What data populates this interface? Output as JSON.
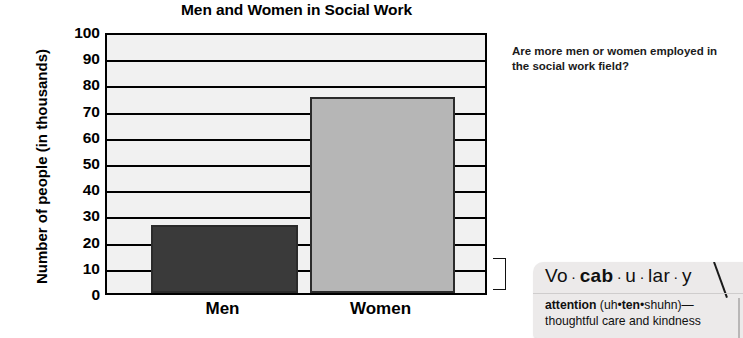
{
  "chart_data": {
    "type": "bar",
    "title": "Men and Women in Social Work",
    "xlabel": "",
    "ylabel": "Number of people (in thousands)",
    "categories": [
      "Men",
      "Women"
    ],
    "values": [
      26,
      75
    ],
    "series": [
      {
        "name": "Number of people (in thousands)",
        "values": [
          26,
          75
        ]
      }
    ],
    "ylim": [
      0,
      100
    ],
    "ytick_labels": [
      "0",
      "10",
      "20",
      "30",
      "40",
      "50",
      "60",
      "70",
      "80",
      "90",
      "100"
    ],
    "ytick_values": [
      0,
      10,
      20,
      30,
      40,
      50,
      60,
      70,
      80,
      90,
      100
    ],
    "grid": true,
    "legend": "none",
    "bar_colors": [
      "#3a3a3a",
      "#b6b6b6"
    ],
    "plot_background": "#f1f1f1",
    "axis_color": "#000000"
  },
  "question": {
    "text": "Are more men or women employed in the social work field?"
  },
  "vocabulary": {
    "heading_parts": [
      {
        "text": "Vo",
        "bold": false
      },
      {
        "text": " · ",
        "bold": false
      },
      {
        "text": "cab",
        "bold": true
      },
      {
        "text": " · ",
        "bold": false
      },
      {
        "text": "u",
        "bold": false
      },
      {
        "text": " · ",
        "bold": false
      },
      {
        "text": "lar",
        "bold": false
      },
      {
        "text": " · ",
        "bold": false
      },
      {
        "text": "y",
        "bold": false
      }
    ],
    "heading_plain": "Vo · cab · u · lar · y",
    "entry_word": "attention",
    "entry_pronunciation_open": " (uh•",
    "entry_pronunciation_stress": "ten",
    "entry_pronunciation_close": "•shuhn)—",
    "entry_definition": "thoughtful care and kindness"
  }
}
